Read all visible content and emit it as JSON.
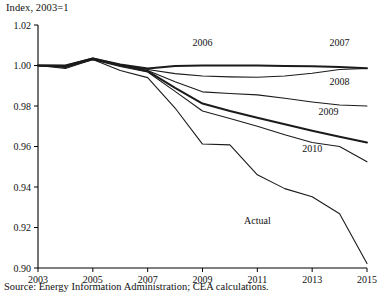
{
  "axis_title": "Index, 2003=1",
  "source_note": "Source: Energy Information Administration; CEA calculations.",
  "labels": {
    "y_2003": "2003",
    "y_2005": "2005",
    "y_2007": "2007",
    "y_2009": "2009",
    "y_2011": "2011",
    "y_2013": "2013",
    "y_2015": "2015",
    "v_102": "1.02",
    "v_100": "1.00",
    "v_098": "0.98",
    "v_096": "0.96",
    "v_094": "0.94",
    "v_092": "0.92",
    "v_090": "0.90",
    "s_2006": "2006",
    "s_2007": "2007",
    "s_2008": "2008",
    "s_2009": "2009",
    "s_2010": "2010",
    "s_actual": "Actual"
  },
  "chart_data": {
    "type": "line",
    "title": "",
    "subtitle": "",
    "xlabel": "",
    "ylabel": "Index, 2003=1",
    "xlim": [
      2003,
      2015
    ],
    "ylim": [
      0.9,
      1.02
    ],
    "xticks": [
      2003,
      2005,
      2007,
      2009,
      2011,
      2013,
      2015
    ],
    "yticks": [
      0.9,
      0.92,
      0.94,
      0.96,
      0.98,
      1.0,
      1.02
    ],
    "grid": false,
    "legend": "inline-annotations",
    "annotations": [
      {
        "text": "2006",
        "x": 2009.0,
        "y": 1.0095
      },
      {
        "text": "2007",
        "x": 2014.0,
        "y": 1.0095
      },
      {
        "text": "2008",
        "x": 2014.0,
        "y": 0.9905
      },
      {
        "text": "2009",
        "x": 2013.6,
        "y": 0.9755
      },
      {
        "text": "2010",
        "x": 2013.0,
        "y": 0.9575
      },
      {
        "text": "Actual",
        "x": 2011.0,
        "y": 0.9215
      }
    ],
    "series": [
      {
        "name": "2006",
        "style": "thick",
        "x": [
          2003,
          2004,
          2005,
          2006,
          2007,
          2008,
          2009,
          2010,
          2011,
          2012,
          2013,
          2014,
          2015
        ],
        "y": [
          1.0,
          1.0,
          1.0035,
          1.0005,
          0.9985,
          0.9997,
          1.0,
          1.0,
          1.0,
          0.9998,
          0.9996,
          0.9992,
          0.9987
        ]
      },
      {
        "name": "2007",
        "style": "thin",
        "x": [
          2003,
          2004,
          2005,
          2006,
          2007,
          2008,
          2009,
          2010,
          2011,
          2012,
          2013,
          2014,
          2015
        ],
        "y": [
          1.0,
          0.9995,
          1.003,
          1.0,
          0.998,
          0.996,
          0.9948,
          0.9944,
          0.9942,
          0.9948,
          0.9962,
          0.998,
          0.9985
        ]
      },
      {
        "name": "2008",
        "style": "thin",
        "x": [
          2003,
          2004,
          2005,
          2006,
          2007,
          2008,
          2009,
          2010,
          2011,
          2012,
          2013,
          2014,
          2015
        ],
        "y": [
          1.0,
          0.999,
          1.0032,
          0.9998,
          0.9975,
          0.992,
          0.987,
          0.9862,
          0.9855,
          0.9838,
          0.982,
          0.9805,
          0.98
        ]
      },
      {
        "name": "2009",
        "style": "thick",
        "x": [
          2003,
          2004,
          2005,
          2006,
          2007,
          2008,
          2009,
          2010,
          2011,
          2012,
          2013,
          2014,
          2015
        ],
        "y": [
          1.0,
          0.9998,
          1.0035,
          1.0002,
          0.9972,
          0.989,
          0.9812,
          0.9775,
          0.9742,
          0.971,
          0.9678,
          0.9648,
          0.962
        ]
      },
      {
        "name": "2010",
        "style": "thin",
        "x": [
          2003,
          2004,
          2005,
          2006,
          2007,
          2008,
          2009,
          2010,
          2011,
          2012,
          2013,
          2014,
          2015
        ],
        "y": [
          1.0,
          0.9992,
          1.0028,
          0.9995,
          0.9968,
          0.9872,
          0.9775,
          0.9738,
          0.97,
          0.9658,
          0.962,
          0.96,
          0.9525
        ]
      },
      {
        "name": "Actual",
        "style": "thin",
        "x": [
          2003,
          2004,
          2005,
          2006,
          2007,
          2008,
          2009,
          2010,
          2011,
          2012,
          2013,
          2014,
          2015
        ],
        "y": [
          1.0,
          0.9985,
          1.003,
          0.9975,
          0.994,
          0.979,
          0.9612,
          0.9608,
          0.946,
          0.9392,
          0.9352,
          0.9268,
          0.9022
        ]
      }
    ]
  }
}
